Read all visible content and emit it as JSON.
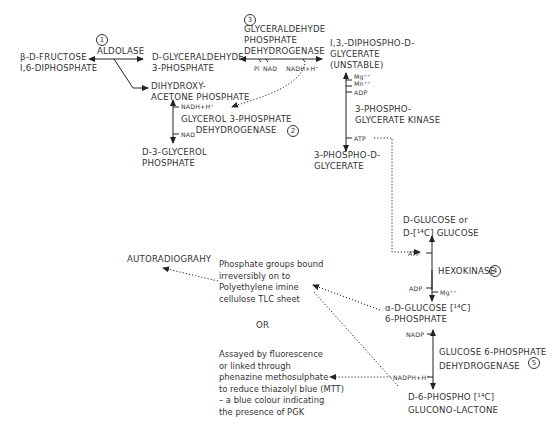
{
  "diagram": {
    "enzymes": [
      {
        "number": "1",
        "name": "ALDOLASE"
      },
      {
        "number": "2",
        "name": "GLYCEROL 3-PHOSPHATE\n     DEHYDROGENASE"
      },
      {
        "number": "3",
        "name": "GLYCERALDEHYDE\nPHOSPHATE\nDEHYDROGENASE"
      },
      {
        "number": "4",
        "name": "HEXOKINASE"
      },
      {
        "number": "5",
        "name": "GLUCOSE 6-PHOSPHATE\nDEHYDROGENASE"
      },
      {
        "number": "",
        "name": "3-PHOSPHO-\nGLYCERATE KINASE"
      }
    ],
    "metabolites": {
      "fructose_bp": "β-D-FRUCTOSE\nI,6-DIPHOSPHATE",
      "g3p": "D-GLYCERALDEHYDE\n3-PHOSPHATE",
      "dhap": "DIHYDROXY-\nACETONE PHOSPHATE",
      "glycerol_3p": "D-3-GLYCEROL\nPHOSPHATE",
      "bpg": "I,3,-DIPHOSPHO-D-\nGLYCERATE\n(UNSTABLE)",
      "pg3": "3-PHOSPHO-D-\nGLYCERATE",
      "glucose": "D-GLUCOSE or\nD-[¹⁴C] GLUCOSE",
      "g6p": "α-D-GLUCOSE [¹⁴C]\n6-PHOSPHATE",
      "lactone": "D-6-PHOSPHO [¹⁴C]\nGLUCONO-LACTONE"
    },
    "cofactors": {
      "pi": "Pi",
      "nad_3": "NAD",
      "nadh_3": "NADH+H⁺",
      "nadh_2": "NADH+H⁺",
      "nad_2": "NAD",
      "mg_pgk": "Mg⁺⁺",
      "mn_pgk": "Mn⁺⁺",
      "adp_pgk": "ADP",
      "atp_pgk": "ATP",
      "atp_hk": "ATP",
      "adp_hk": "ADP",
      "mg_hk": "Mg⁺⁺",
      "nadp": "NADP",
      "nadph": "NADPH+H⁺"
    },
    "detection": {
      "autoradiography": "AUTORADIOGRAHY",
      "tlc_note": "Phosphate groups bound\nirreversibly on to\nPolyethylene imine\ncellulose TLC sheet",
      "or": "OR",
      "assay_note": "Assayed by fluorescence\nor linked through\nphenazine methosulphate\nto reduce thiazolyl blue (MTT)\n– a blue colour indicating\nthe presence of PGK"
    }
  }
}
